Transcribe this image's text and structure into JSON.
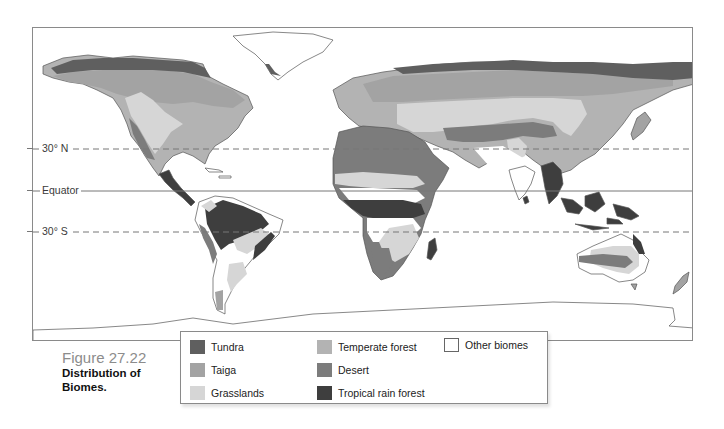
{
  "figure": {
    "number": "Figure 27.22",
    "title_line1": "Distribution of",
    "title_line2": "Biomes."
  },
  "map": {
    "latitude_lines": [
      {
        "label": "30° N",
        "style": "dashed",
        "y": 148
      },
      {
        "label": "Equator",
        "style": "solid",
        "y": 190
      },
      {
        "label": "30° S",
        "style": "dashed",
        "y": 231
      }
    ]
  },
  "legend": {
    "items": [
      {
        "label": "Tundra",
        "color": "#5f5f5f"
      },
      {
        "label": "Taiga",
        "color": "#a3a3a3"
      },
      {
        "label": "Grasslands",
        "color": "#d6d6d6"
      },
      {
        "label": "Temperate forest",
        "color": "#b3b3b3"
      },
      {
        "label": "Desert",
        "color": "#7c7c7c"
      },
      {
        "label": "Tropical rain forest",
        "color": "#3e3e3e"
      },
      {
        "label": "Other biomes",
        "color": "#ffffff"
      }
    ]
  },
  "colors": {
    "tundra": "#5f5f5f",
    "taiga": "#a3a3a3",
    "grasslands": "#d6d6d6",
    "temperate_forest": "#b3b3b3",
    "desert": "#7c7c7c",
    "tropical_rain_forest": "#3e3e3e",
    "other": "#ffffff",
    "outline": "#555555"
  }
}
